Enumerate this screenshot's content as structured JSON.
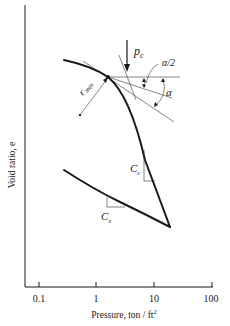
{
  "diagram": {
    "axes": {
      "x_label": "Pressure, ton / ft",
      "x_label_sup": "2",
      "y_label": "Void ratio, e",
      "x_scale": "log",
      "x_ticks": [
        "0.1",
        "1",
        "10",
        "100"
      ]
    },
    "annotations": {
      "pc": "p",
      "pc_sub": "c",
      "alpha_half": "α/2",
      "alpha": "α",
      "rmin": "r",
      "rmin_sub": "min",
      "cc": "C",
      "cc_sub": "c",
      "cs": "C",
      "cs_sub": "s"
    },
    "colors": {
      "ink": "#1a1a1a",
      "thin_line": "#333333",
      "background": "#ffffff"
    }
  }
}
